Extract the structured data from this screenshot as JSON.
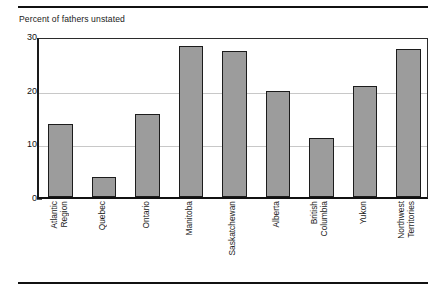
{
  "chart_data": {
    "type": "bar",
    "title": "Percent of fathers unstated",
    "xlabel": "",
    "ylabel": "Percent of fathers unstated",
    "ylim": [
      0,
      30
    ],
    "yticks": [
      0,
      10,
      20,
      30
    ],
    "ytick_labels": [
      "0",
      "10",
      "20",
      "30"
    ],
    "grid": "horizontal",
    "legend": "none",
    "bar_color": "#9c9c9c",
    "bar_edge_color": "#1c1c1c",
    "categories": [
      "Atlantic Region",
      "Quebec",
      "Ontario",
      "Manitoba",
      "Saskatchewan",
      "Alberta",
      "British Columbia",
      "Yukon",
      "Northwest Territories"
    ],
    "values": [
      13.6,
      3.7,
      15.5,
      28.1,
      27.3,
      19.7,
      11.0,
      20.6,
      27.5
    ]
  },
  "figure": {
    "title": "Percent of fathers unstated",
    "top_rule": "horizontal-rule",
    "bottom_rule": "horizontal-rule"
  }
}
